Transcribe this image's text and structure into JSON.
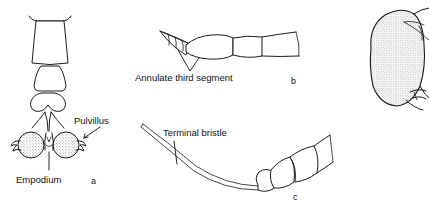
{
  "figure": {
    "kind": "scientific-line-drawing-plate",
    "background_color": "#ffffff",
    "ink_color": "#1b1b1b",
    "panels": [
      {
        "id": "a",
        "letter": "a",
        "subject": "fly tarsus tip with claws, pulvilli and empodium",
        "labels": [
          {
            "name": "pulvillus",
            "text": "Pulvillus"
          },
          {
            "name": "empodium",
            "text": "Empodium"
          }
        ]
      },
      {
        "id": "b",
        "letter": "b",
        "subject": "antenna with annulate third segment",
        "labels": [
          {
            "name": "annulate-third-segment",
            "text": "Annulate third segment"
          }
        ]
      },
      {
        "id": "c",
        "letter": "c",
        "subject": "antenna with terminal bristle",
        "labels": [
          {
            "name": "terminal-bristle",
            "text": "Terminal bristle"
          }
        ]
      },
      {
        "id": "d",
        "letter": "",
        "subject": "partial fly head with stippled compound eye, cropped at right edge",
        "labels": []
      }
    ]
  }
}
